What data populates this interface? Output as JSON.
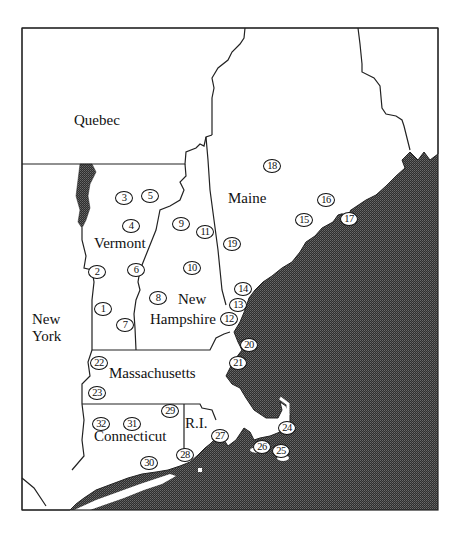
{
  "map": {
    "title": "",
    "colors": {
      "land": "#ffffff",
      "water": "#3a3a3a",
      "border": "#222222",
      "frame": "#222222"
    },
    "regions": [
      {
        "id": "quebec",
        "label": "Quebec",
        "x": 92,
        "y": 110
      },
      {
        "id": "vermont",
        "label": "Vermont",
        "x": 95,
        "y": 235
      },
      {
        "id": "maine",
        "label": "Maine",
        "x": 228,
        "y": 190
      },
      {
        "id": "new-hampshire-1",
        "label": "New",
        "x": 178,
        "y": 291
      },
      {
        "id": "new-hampshire-2",
        "label": "Hampshire",
        "x": 150,
        "y": 311
      },
      {
        "id": "new-york-1",
        "label": "New",
        "x": 32,
        "y": 311
      },
      {
        "id": "new-york-2",
        "label": "York",
        "x": 32,
        "y": 328
      },
      {
        "id": "massachusetts",
        "label": "Massachusetts",
        "x": 109,
        "y": 365
      },
      {
        "id": "connecticut",
        "label": "Connecticut",
        "x": 94,
        "y": 428
      },
      {
        "id": "rhode-island",
        "label": "R.I.",
        "x": 185,
        "y": 415
      }
    ],
    "markers": [
      {
        "n": "1",
        "x": 103,
        "y": 309
      },
      {
        "n": "2",
        "x": 97,
        "y": 272
      },
      {
        "n": "3",
        "x": 124,
        "y": 198
      },
      {
        "n": "4",
        "x": 131,
        "y": 226
      },
      {
        "n": "5",
        "x": 150,
        "y": 196
      },
      {
        "n": "6",
        "x": 136,
        "y": 270
      },
      {
        "n": "7",
        "x": 125,
        "y": 325
      },
      {
        "n": "8",
        "x": 158,
        "y": 298
      },
      {
        "n": "9",
        "x": 181,
        "y": 224
      },
      {
        "n": "10",
        "x": 192,
        "y": 268
      },
      {
        "n": "11",
        "x": 205,
        "y": 232
      },
      {
        "n": "12",
        "x": 229,
        "y": 319
      },
      {
        "n": "13",
        "x": 238,
        "y": 305
      },
      {
        "n": "14",
        "x": 243,
        "y": 289
      },
      {
        "n": "15",
        "x": 304,
        "y": 220
      },
      {
        "n": "16",
        "x": 326,
        "y": 200
      },
      {
        "n": "17",
        "x": 349,
        "y": 219
      },
      {
        "n": "18",
        "x": 272,
        "y": 166
      },
      {
        "n": "19",
        "x": 232,
        "y": 244
      },
      {
        "n": "20",
        "x": 249,
        "y": 345
      },
      {
        "n": "21",
        "x": 238,
        "y": 363
      },
      {
        "n": "22",
        "x": 99,
        "y": 363
      },
      {
        "n": "23",
        "x": 97,
        "y": 393
      },
      {
        "n": "24",
        "x": 287,
        "y": 428
      },
      {
        "n": "25",
        "x": 281,
        "y": 451
      },
      {
        "n": "26",
        "x": 262,
        "y": 447
      },
      {
        "n": "27",
        "x": 220,
        "y": 436
      },
      {
        "n": "28",
        "x": 185,
        "y": 455
      },
      {
        "n": "29",
        "x": 170,
        "y": 411
      },
      {
        "n": "30",
        "x": 149,
        "y": 463
      },
      {
        "n": "31",
        "x": 132,
        "y": 424
      },
      {
        "n": "32",
        "x": 101,
        "y": 424
      }
    ]
  }
}
